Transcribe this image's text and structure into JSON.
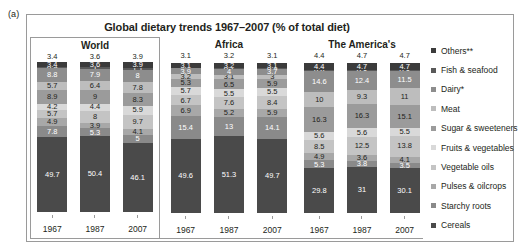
{
  "figure_label": "(a)",
  "chart_data": {
    "type": "bar",
    "subtype": "stacked-bar-100",
    "title": "Global dietary trends 1967–2007 (% of total diet)",
    "xlabel": "",
    "ylabel": "",
    "ylim": [
      0,
      100
    ],
    "grid": false,
    "legend_position": "right",
    "categories": [
      "1967",
      "1987",
      "2007"
    ],
    "groups": [
      "World",
      "Africa",
      "The America's"
    ],
    "series": [
      {
        "name": "Others**",
        "color": "#3b3b3b",
        "values": {
          "World": [
            3.4,
            3.6,
            3.9
          ],
          "Africa": [
            3.1,
            3.2,
            3.1
          ],
          "The America's": [
            4.4,
            4.7,
            4.7
          ]
        }
      },
      {
        "name": "Fish & seafood",
        "color": "#595959",
        "values": {
          "World": [
            0.9,
            1,
            1.1
          ],
          "Africa": [
            0.5,
            0.7,
            0.9
          ],
          "The America's": [
            0.6,
            0.8,
            0.8
          ]
        }
      },
      {
        "name": "Dairy*",
        "color": "#8d8d8d",
        "values": {
          "World": [
            8.8,
            7.9,
            8
          ],
          "Africa": [
            3.9,
            4,
            3.7
          ],
          "The America's": [
            14.6,
            12.4,
            11.5
          ]
        }
      },
      {
        "name": "Meat",
        "color": "#bdbdbd",
        "values": {
          "World": [
            5.7,
            6.4,
            7.8
          ],
          "Africa": [
            3.2,
            3.1,
            3
          ],
          "The America's": [
            10,
            9.3,
            11
          ]
        }
      },
      {
        "name": "Sugar & sweeteners",
        "color": "#9b9b9b",
        "values": {
          "World": [
            8.9,
            9,
            8.3
          ],
          "Africa": [
            5.3,
            6.5,
            5.9
          ],
          "The America's": [
            16.3,
            16.3,
            15.1
          ]
        }
      },
      {
        "name": "Fruits & vegetables",
        "color": "#d9d9d9",
        "values": {
          "World": [
            4.2,
            4.4,
            5.9
          ],
          "Africa": [
            5.7,
            5.5,
            5.5
          ],
          "The America's": [
            5.6,
            5.6,
            5.5
          ]
        }
      },
      {
        "name": "Vegetable oils",
        "color": "#c4c4c4",
        "values": {
          "World": [
            5.7,
            8,
            9.7
          ],
          "Africa": [
            6.7,
            7.6,
            8.4
          ],
          "The America's": [
            8.5,
            12.5,
            13.8
          ]
        }
      },
      {
        "name": "Pulses & oilcrops",
        "color": "#a8a8a8",
        "values": {
          "World": [
            4.9,
            3.9,
            4.1
          ],
          "Africa": [
            6.9,
            5.2,
            5.9
          ],
          "The America's": [
            4.9,
            3.6,
            4.1
          ]
        }
      },
      {
        "name": "Starchy roots",
        "color": "#8a8a8a",
        "values": {
          "World": [
            7.8,
            5.3,
            5
          ],
          "Africa": [
            15.4,
            13,
            14.1
          ],
          "The America's": [
            5.3,
            3.8,
            3.5
          ]
        }
      },
      {
        "name": "Cereals",
        "color": "#4a4a4a",
        "values": {
          "World": [
            49.7,
            50.4,
            46.1
          ],
          "Africa": [
            49.6,
            51.3,
            49.7
          ],
          "The America's": [
            29.8,
            31,
            30.1
          ]
        }
      }
    ]
  }
}
